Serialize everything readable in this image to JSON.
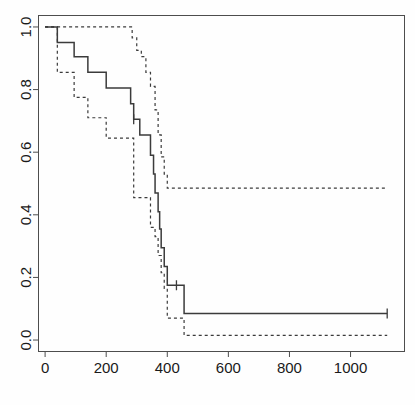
{
  "chart_data": {
    "type": "line",
    "title": "",
    "subtitle": "",
    "xlabel": "",
    "ylabel": "",
    "xlim": [
      -20,
      1175
    ],
    "ylim": [
      -0.035,
      1.035
    ],
    "xticks": [
      0,
      200,
      400,
      600,
      800,
      1000
    ],
    "xtick_labels": [
      "0",
      "200",
      "400",
      "600",
      "800",
      "1000"
    ],
    "yticks": [
      0.0,
      0.2,
      0.4,
      0.6,
      0.8,
      1.0
    ],
    "ytick_labels": [
      "0.0",
      "0.2",
      "0.4",
      "0.6",
      "0.8",
      "1.0"
    ],
    "grid": false,
    "legend_position": "none",
    "plot_style": "kaplan-meier-step",
    "axis_color": "#4d4d4d",
    "series": [
      {
        "name": "Survival estimate",
        "style": "solid",
        "color": "#3b3b3b",
        "step": "post",
        "x": [
          0,
          30,
          40,
          95,
          140,
          200,
          280,
          290,
          300,
          310,
          330,
          345,
          355,
          360,
          370,
          375,
          380,
          390,
          400,
          430,
          455,
          1120
        ],
        "y": [
          1.0,
          1.0,
          0.95,
          0.905,
          0.855,
          0.805,
          0.755,
          0.705,
          0.705,
          0.655,
          0.655,
          0.59,
          0.53,
          0.47,
          0.41,
          0.355,
          0.295,
          0.235,
          0.175,
          0.175,
          0.085,
          0.085
        ]
      },
      {
        "name": "Upper 95% confidence limit",
        "style": "dashed",
        "color": "#3b3b3b",
        "step": "post",
        "x": [
          0,
          30,
          270,
          285,
          300,
          315,
          330,
          345,
          360,
          370,
          380,
          390,
          400,
          1120
        ],
        "y": [
          1.0,
          1.0,
          1.0,
          0.965,
          0.925,
          0.905,
          0.855,
          0.81,
          0.735,
          0.655,
          0.585,
          0.53,
          0.485,
          0.485
        ]
      },
      {
        "name": "Lower 95% confidence limit",
        "style": "dashed",
        "color": "#3b3b3b",
        "step": "post",
        "x": [
          0,
          30,
          40,
          95,
          140,
          185,
          200,
          270,
          290,
          330,
          345,
          360,
          370,
          380,
          390,
          400,
          430,
          455,
          1120
        ],
        "y": [
          1.0,
          1.0,
          0.855,
          0.775,
          0.71,
          0.71,
          0.645,
          0.645,
          0.455,
          0.455,
          0.36,
          0.33,
          0.27,
          0.215,
          0.165,
          0.07,
          0.07,
          0.015,
          0.015
        ]
      }
    ],
    "censor_marks": [
      {
        "label": "censored-observation-1",
        "x": 290,
        "y": 0.705
      },
      {
        "label": "censored-observation-2",
        "x": 430,
        "y": 0.175
      },
      {
        "label": "censored-observation-3",
        "x": 1120,
        "y": 0.085
      }
    ],
    "annotations": []
  },
  "axes": {
    "x_axis_name": "time-axis",
    "y_axis_name": "survival-probability-axis"
  }
}
